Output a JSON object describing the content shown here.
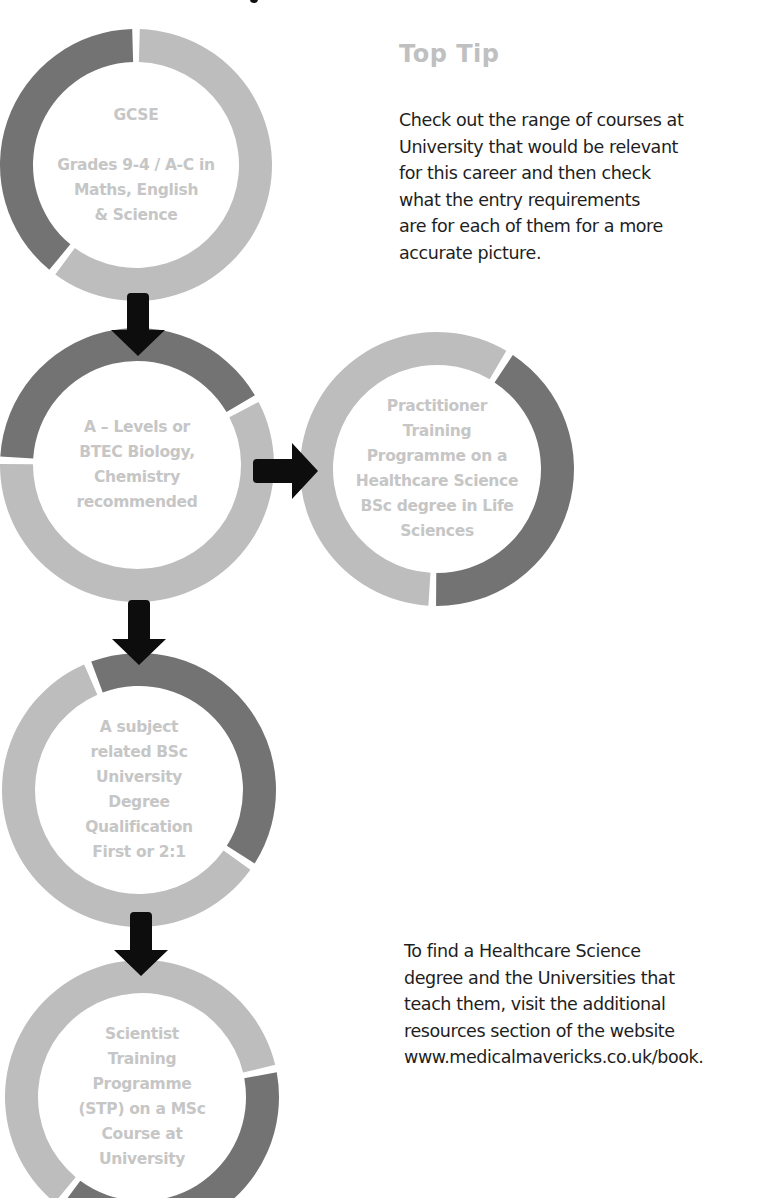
{
  "colors": {
    "ring_dark": "#737373",
    "ring_light": "#bdbdbd",
    "node_text": "#c6c6c6",
    "arrow": "#0d0d0d",
    "heading": "#c0c0c0",
    "body_text": "#1e1e1e"
  },
  "nodes": [
    {
      "id": "gcse",
      "lines": [
        "GCSE",
        "",
        "Grades 9-4 / A-C in",
        "Maths, English",
        "& Science"
      ],
      "cx": 136,
      "cy": 165,
      "r": 136,
      "thickness": 33,
      "dark_segment_deg": [
        218,
        360
      ]
    },
    {
      "id": "a-levels",
      "lines": [
        "A – Levels or",
        "BTEC Biology,",
        "Chemistry",
        "recommended"
      ],
      "cx": 137,
      "cy": 465,
      "r": 137,
      "thickness": 33,
      "dark_segment_deg": [
        272,
        421
      ]
    },
    {
      "id": "ptp",
      "lines": [
        "Practitioner",
        "Training",
        "Programme on a",
        "Healthcare Science",
        "BSc degree in Life",
        "Sciences"
      ],
      "cx": 437,
      "cy": 469,
      "r": 137,
      "thickness": 33,
      "dark_segment_deg": [
        32,
        182
      ]
    },
    {
      "id": "bsc-degree",
      "lines": [
        "A subject",
        "related BSc",
        "University",
        "Degree",
        "Qualification",
        "First or 2:1"
      ],
      "cx": 139,
      "cy": 790,
      "r": 137,
      "thickness": 33,
      "dark_segment_deg": [
        338,
        484
      ]
    },
    {
      "id": "stp",
      "lines": [
        "Scientist",
        "Training",
        "Programme",
        "(STP) on a MSc",
        "Course at",
        "University"
      ],
      "cx": 142,
      "cy": 1097,
      "r": 137,
      "thickness": 33,
      "dark_segment_deg": [
        78,
        218
      ]
    }
  ],
  "arrows": [
    {
      "id": "gcse-to-alevels",
      "direction": "down",
      "x": 138,
      "y1": 293,
      "y2": 356
    },
    {
      "id": "alevels-to-ptp",
      "direction": "right",
      "y": 471,
      "x1": 253,
      "x2": 318
    },
    {
      "id": "alevels-to-bsc",
      "direction": "down",
      "x": 139,
      "y1": 600,
      "y2": 665
    },
    {
      "id": "bsc-to-stp",
      "direction": "down",
      "x": 141,
      "y1": 912,
      "y2": 976
    }
  ],
  "top_tip": {
    "heading": "Top Tip",
    "lines": [
      "Check out the range of courses at",
      "University that would be relevant",
      "for this career and then check",
      "what the entry requirements",
      "are for each of them for a more",
      "accurate picture."
    ]
  },
  "resources": {
    "lines": [
      "To find a Healthcare Science",
      "degree and the Universities that",
      "teach them, visit the additional",
      "resources section of the website",
      "www.medicalmavericks.co.uk/book."
    ]
  }
}
